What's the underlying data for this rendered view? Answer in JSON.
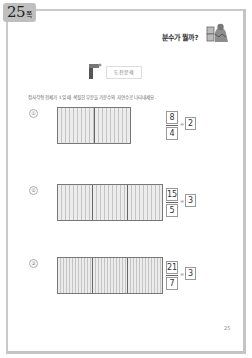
{
  "page_tab": {
    "number": "25",
    "unit": "쪽"
  },
  "header": {
    "title": "분수가 뭘까?",
    "icon": "character-icon"
  },
  "section": {
    "label": "도전문제",
    "icon": "flag-icon"
  },
  "instruction": "정사각형 전체가 1일 때 색칠한 부분을 가분수와 자연수로 나타내세요.",
  "problems": [
    {
      "marker": "①",
      "cells": 2,
      "numerator": "8",
      "denominator": "4",
      "equals": "=",
      "answer": "2"
    },
    {
      "marker": "②",
      "cells": 3,
      "numerator": "15",
      "denominator": "5",
      "equals": "=",
      "answer": "3"
    },
    {
      "marker": "③",
      "cells": 3,
      "numerator": "21",
      "denominator": "7",
      "equals": "=",
      "answer": "3"
    }
  ],
  "footer": {
    "page_number": "25"
  }
}
